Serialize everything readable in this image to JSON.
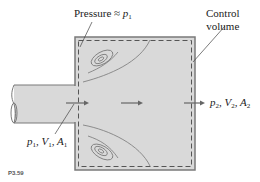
{
  "diagram": {
    "type": "control-volume sudden expansion",
    "labels": {
      "pressure": "Pressure ≈ ",
      "pressure_var": "p",
      "pressure_sub": "1",
      "control_volume_line1": "Control",
      "control_volume_line2": "volume",
      "inlet": {
        "p": "p",
        "p_sub": "1",
        "V": "V",
        "V_sub": "1",
        "A": "A",
        "A_sub": "1"
      },
      "outlet": {
        "p": "p",
        "p_sub": "2",
        "V": "V",
        "V_sub": "2",
        "A": "A",
        "A_sub": "2"
      }
    },
    "figure_caption": "P3.59",
    "colors": {
      "fill": "#d9d9d9",
      "wall": "#7a7a7a",
      "dashed": "#555555",
      "text": "#222222",
      "arrow": "#666666"
    }
  }
}
